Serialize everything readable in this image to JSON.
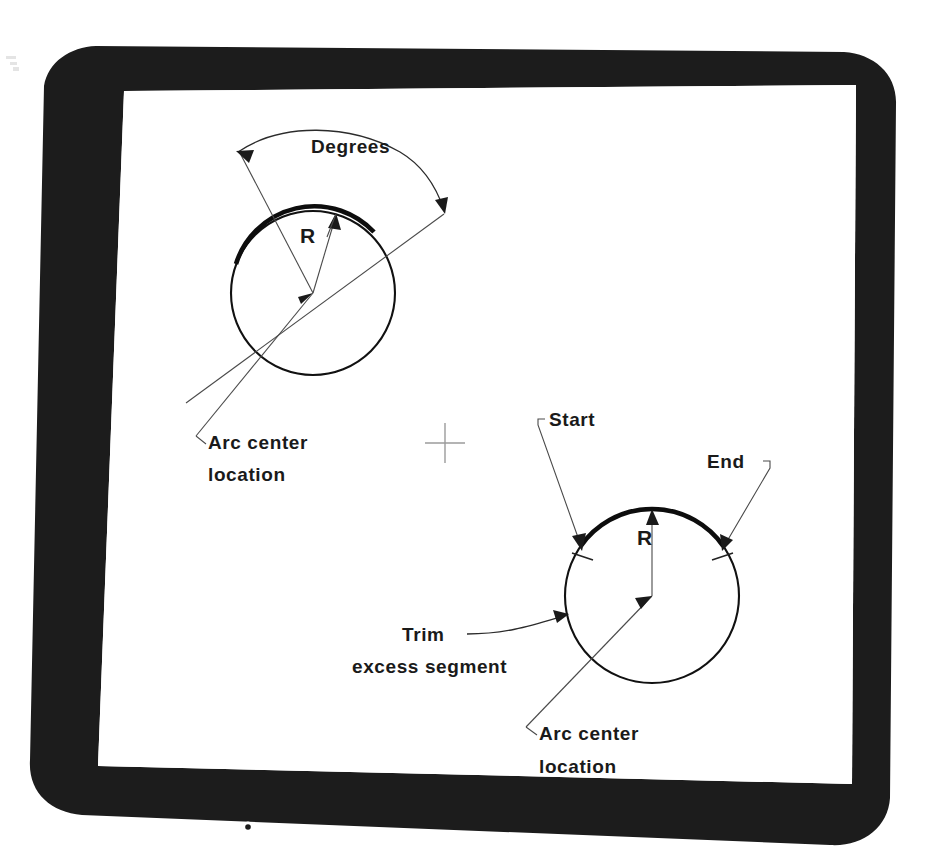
{
  "document": {
    "title": "Arc center / degrees construction diagram",
    "background_color": "#ffffff",
    "bezel_color": "#1c1c1c",
    "screen_color": "#ffffff",
    "ink_color": "#111111"
  },
  "monitor": {
    "name": "crt-monitor-bezel",
    "power_indicator_label": "o"
  },
  "diagram_top": {
    "name": "arc-by-center-radius-degrees",
    "labels": {
      "degrees": "Degrees",
      "radius": "R",
      "arc_center_line1": "Arc center",
      "arc_center_line2": "location"
    },
    "geometry": {
      "circle_center_x": 313,
      "circle_center_y": 293,
      "circle_radius": 82,
      "arc_start_deg": 200,
      "arc_end_deg": 318
    }
  },
  "diagram_bottom": {
    "name": "arc-by-start-end-trim",
    "labels": {
      "start": "Start",
      "end": "End",
      "radius": "R",
      "trim": "Trim",
      "trim_second_line": "excess segment",
      "arc_center_line1": "Arc center",
      "arc_center_line2": "location"
    },
    "geometry": {
      "circle_center_x": 652,
      "circle_center_y": 596,
      "circle_radius": 87,
      "arc_start_deg": 215,
      "arc_end_deg": 325
    }
  },
  "center_mark": {
    "name": "crosshair-mark",
    "x": 445,
    "y": 443
  }
}
